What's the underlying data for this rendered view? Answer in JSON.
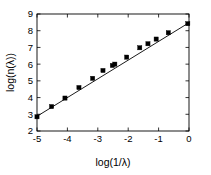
{
  "chart_data": {
    "type": "scatter",
    "title": "",
    "subtitle": "",
    "xlabel": "log(1/λ)",
    "ylabel": "log(n(λ))",
    "xlim": [
      -5,
      0
    ],
    "ylim": [
      2,
      9
    ],
    "xticks": [
      -5,
      -4,
      -3,
      -2,
      -1,
      0
    ],
    "xticklabels": [
      "-5",
      "-4",
      "-3",
      "-2",
      "-1",
      "0"
    ],
    "yticks": [
      2,
      3,
      4,
      5,
      6,
      7,
      8,
      9
    ],
    "yticklabels": [
      "2",
      "3",
      "4",
      "5",
      "6",
      "7",
      "8",
      "9"
    ],
    "grid": false,
    "legend": null,
    "legend_position": "none",
    "box_frame": true,
    "tick_direction": "in",
    "marker_style": "filled-square",
    "marker_color": "#000000",
    "line_color": "#000000",
    "background_color": "#ffffff",
    "series": [
      {
        "name": "data",
        "kind": "scatter",
        "x": [
          -5.0,
          -4.52,
          -4.08,
          -3.62,
          -3.17,
          -2.83,
          -2.52,
          -2.44,
          -2.05,
          -1.62,
          -1.35,
          -1.08,
          -0.68,
          -0.04
        ],
        "y": [
          2.85,
          3.46,
          3.97,
          4.6,
          5.15,
          5.62,
          5.92,
          6.0,
          6.42,
          6.98,
          7.22,
          7.5,
          7.88,
          8.42
        ]
      },
      {
        "name": "linear fit",
        "kind": "line",
        "x": [
          -5.0,
          0.0
        ],
        "y": [
          2.88,
          8.48
        ],
        "slope": 1.12,
        "intercept": 8.48
      }
    ]
  },
  "axes": {
    "x_title": "log(1/λ)",
    "y_title": "log(n(λ))"
  }
}
